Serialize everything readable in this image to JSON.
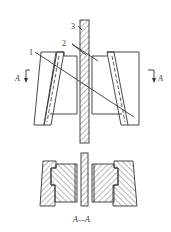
{
  "diagram": {
    "type": "mechanical-drawing",
    "labels": {
      "part1": "1",
      "part2": "2",
      "part3": "3",
      "section_left": "A",
      "section_right": "A",
      "section_caption": "A—A"
    },
    "colors": {
      "line": "#333333",
      "background": "#ffffff"
    }
  }
}
